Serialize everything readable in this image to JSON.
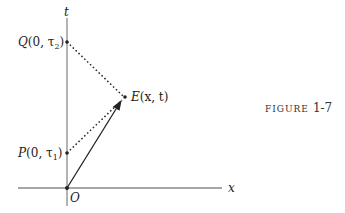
{
  "figure": {
    "caption_word": "FIGURE",
    "caption_number": "1-7"
  },
  "axes": {
    "t_label": "t",
    "x_label": "x"
  },
  "points": {
    "Q": {
      "name": "Q",
      "coords": "(0, τ",
      "sub": "2",
      "close": ")"
    },
    "P": {
      "name": "P",
      "coords": "(0, τ",
      "sub": "1",
      "close": ")"
    },
    "E": {
      "name": "E",
      "coords": "(x, t)"
    },
    "O": {
      "name": "O"
    }
  },
  "colors": {
    "axis": "#8a8a8a",
    "line": "#222222"
  }
}
